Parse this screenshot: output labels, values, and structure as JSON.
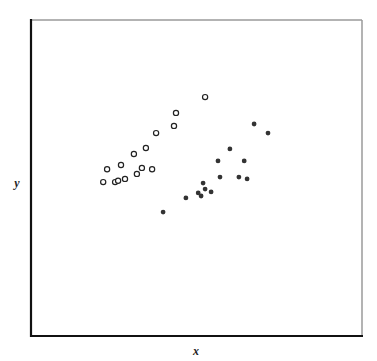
{
  "chart_data": {
    "type": "scatter",
    "title": "",
    "xlabel": "x",
    "ylabel": "y",
    "xlim": [
      0,
      100
    ],
    "ylim": [
      0,
      100
    ],
    "grid": false,
    "ticks": false,
    "legend": null,
    "series": [
      {
        "name": "open",
        "marker": "open-circle",
        "color": "#222222",
        "points": [
          [
            21.8,
            48.7
          ],
          [
            23.0,
            52.8
          ],
          [
            25.4,
            48.7
          ],
          [
            26.3,
            49.1
          ],
          [
            27.2,
            54.1
          ],
          [
            28.4,
            49.7
          ],
          [
            31.1,
            57.6
          ],
          [
            32.0,
            51.3
          ],
          [
            33.5,
            53.2
          ],
          [
            34.7,
            59.5
          ],
          [
            36.6,
            52.8
          ],
          [
            37.8,
            64.2
          ],
          [
            43.2,
            66.5
          ],
          [
            43.8,
            70.6
          ],
          [
            52.6,
            75.6
          ]
        ]
      },
      {
        "name": "filled",
        "marker": "filled-circle",
        "color": "#333333",
        "points": [
          [
            39.9,
            39.2
          ],
          [
            46.8,
            43.7
          ],
          [
            50.5,
            45.3
          ],
          [
            51.4,
            44.3
          ],
          [
            52.0,
            48.4
          ],
          [
            52.6,
            46.5
          ],
          [
            54.4,
            45.6
          ],
          [
            56.5,
            55.4
          ],
          [
            57.1,
            50.3
          ],
          [
            60.1,
            59.2
          ],
          [
            62.8,
            50.3
          ],
          [
            64.4,
            55.4
          ],
          [
            65.3,
            49.7
          ],
          [
            67.4,
            67.1
          ],
          [
            71.6,
            64.2
          ]
        ]
      }
    ]
  },
  "plot": {
    "xlabel": "x",
    "ylabel": "y"
  }
}
